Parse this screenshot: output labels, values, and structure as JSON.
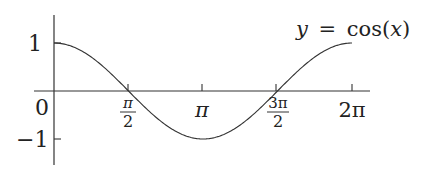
{
  "chart_data": {
    "type": "line",
    "title": "",
    "annotation": "y = cos(x)",
    "annotation_parts": {
      "lhs": "y",
      "eq": "=",
      "fn": "cos",
      "lp": "(",
      "var": "x",
      "rp": ")"
    },
    "xlabel": "",
    "ylabel": "",
    "xlim": [
      0,
      6.2832
    ],
    "ylim": [
      -1,
      1
    ],
    "grid": false,
    "legend": "none",
    "x_ticks": [
      {
        "value": 0,
        "label": "0"
      },
      {
        "value": 1.5708,
        "label": "π/2",
        "num": "π",
        "den": "2"
      },
      {
        "value": 3.1416,
        "label": "π"
      },
      {
        "value": 4.7124,
        "label": "3π/2",
        "num": "3π",
        "den": "2"
      },
      {
        "value": 6.2832,
        "label": "2π"
      }
    ],
    "y_ticks": [
      {
        "value": 1,
        "label": "1"
      },
      {
        "value": -1,
        "label": "−1"
      }
    ],
    "series": [
      {
        "name": "y = cos(x)",
        "x": [
          0,
          0.7854,
          1.5708,
          2.3562,
          3.1416,
          3.927,
          4.7124,
          5.4978,
          6.2832
        ],
        "values": [
          1,
          0.7071,
          0,
          -0.7071,
          -1,
          -0.7071,
          0,
          0.7071,
          1
        ]
      }
    ]
  }
}
